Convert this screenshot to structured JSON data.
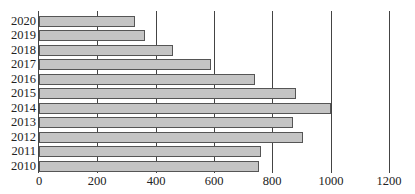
{
  "chart_data": {
    "type": "bar",
    "orientation": "horizontal",
    "title": "",
    "xlabel": "",
    "ylabel": "",
    "categories": [
      "2020",
      "2019",
      "2018",
      "2017",
      "2016",
      "2015",
      "2014",
      "2013",
      "2012",
      "2011",
      "2010"
    ],
    "values": [
      330,
      365,
      460,
      590,
      740,
      880,
      1000,
      870,
      905,
      760,
      755
    ],
    "xlim": [
      0,
      1200
    ],
    "xticks": [
      "0",
      "200",
      "400",
      "600",
      "800",
      "1000",
      "1200"
    ],
    "grid": true,
    "legend": null,
    "bar_color": "#c4c4c4",
    "bar_edge_color": "#555555"
  }
}
